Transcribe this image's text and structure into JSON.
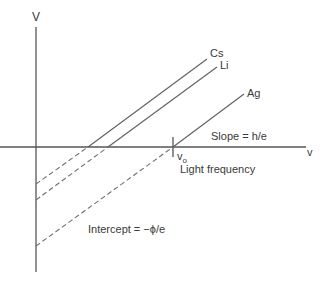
{
  "diagram": {
    "type": "photoelectric-effect-stopping-voltage-vs-frequency",
    "y_axis_label": "V",
    "x_axis_label": "v",
    "series": [
      {
        "name": "Cs",
        "label": "Cs"
      },
      {
        "name": "Li",
        "label": "Li"
      },
      {
        "name": "Ag",
        "label": "Ag"
      }
    ],
    "annotations": {
      "slope": "Slope = h/e",
      "threshold_symbol": "v",
      "threshold_subscript": "o",
      "x_description": "Light frequency",
      "intercept": "Intercept = −ϕ/e"
    },
    "colors": {
      "lines": "#606060",
      "axes": "#555555",
      "text": "#3a3a3a",
      "background": "#ffffff"
    }
  }
}
